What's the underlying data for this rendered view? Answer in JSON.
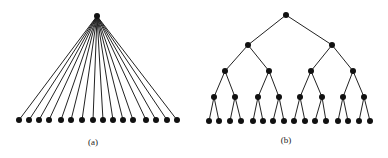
{
  "figure": {
    "panels": [
      {
        "id": "a",
        "caption": "(a)",
        "type": "star / flat tree",
        "root": {
          "x": 97,
          "y": 16
        },
        "leaf_y": 120,
        "leaf_xs": [
          19,
          29,
          39,
          49,
          61,
          71,
          82,
          93,
          103,
          113,
          123,
          133,
          146,
          156,
          167,
          177
        ],
        "leaf_count": 16
      },
      {
        "id": "b",
        "caption": "(b)",
        "type": "binary tree",
        "levels": [
          {
            "y": 15,
            "xs": [
              286
            ]
          },
          {
            "y": 45,
            "xs": [
              248,
              332
            ]
          },
          {
            "y": 71,
            "xs": [
              225,
              269,
              311,
              353
            ]
          },
          {
            "y": 97,
            "xs": [
              214,
              235,
              258,
              279,
              300,
              322,
              343,
              364
            ]
          },
          {
            "y": 121,
            "xs": [
              209,
              219,
              230,
              241,
              253,
              263,
              273,
              284,
              294,
              305,
              315,
              326,
              338,
              348,
              359,
              370
            ]
          }
        ],
        "leaf_count": 16
      }
    ],
    "colors": {
      "node": "#111111",
      "edge": "#222222",
      "background": "#ffffff"
    },
    "node_radius": 3
  }
}
